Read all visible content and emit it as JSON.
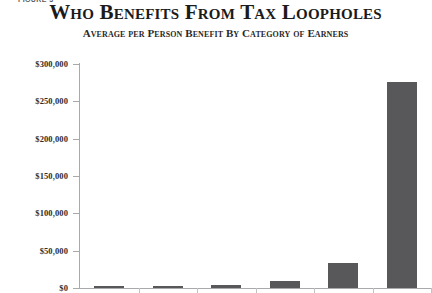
{
  "figure_label": "FIGURE 3",
  "chart_data": {
    "type": "bar",
    "title": "Who Benefits From Tax Loopholes",
    "subtitle": "Average per Person Benefit By Category of Earners",
    "xlabel": "",
    "ylabel": "",
    "grid": false,
    "legend": "none",
    "bar_color": "#58585a",
    "axis_color": "#a9a9ab",
    "ylim": [
      0,
      300000
    ],
    "ytick_values": [
      300000,
      250000,
      200000,
      150000,
      100000,
      50000,
      0
    ],
    "ytick_labels": [
      "$300,000",
      "$250,000",
      "$200,000",
      "$150,000",
      "$100,000",
      "$50,000",
      "$0"
    ],
    "categories": [
      "",
      "",
      "",
      "",
      "",
      ""
    ],
    "values": [
      1200,
      2400,
      3600,
      10000,
      34000,
      276000
    ],
    "series": [
      {
        "name": "Average per person benefit",
        "values": [
          1200,
          2400,
          3600,
          10000,
          34000,
          276000
        ]
      }
    ]
  }
}
